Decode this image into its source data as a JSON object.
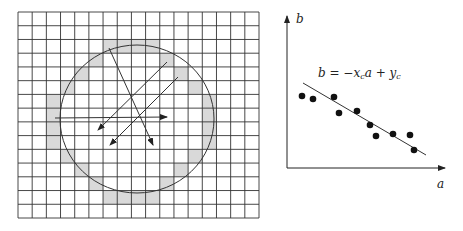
{
  "colors": {
    "grid_line": "#333333",
    "shade": "#d9d9d9",
    "stroke": "#333333",
    "point": "#111111",
    "background": "#ffffff"
  },
  "left_panel": {
    "grid": {
      "x0": 18,
      "y0": 12,
      "x1": 259,
      "y1": 218,
      "cols": 17,
      "rows": 15
    },
    "shaded_cells": [
      [
        2,
        6
      ],
      [
        2,
        7
      ],
      [
        2,
        8
      ],
      [
        2,
        9
      ],
      [
        3,
        5
      ],
      [
        3,
        10
      ],
      [
        4,
        4
      ],
      [
        4,
        11
      ],
      [
        5,
        3
      ],
      [
        5,
        12
      ],
      [
        6,
        2
      ],
      [
        6,
        13
      ],
      [
        7,
        2
      ],
      [
        7,
        13
      ],
      [
        8,
        2
      ],
      [
        8,
        13
      ],
      [
        9,
        2
      ],
      [
        9,
        13
      ],
      [
        10,
        3
      ],
      [
        10,
        12
      ],
      [
        11,
        4
      ],
      [
        11,
        11
      ],
      [
        12,
        5
      ],
      [
        12,
        10
      ],
      [
        13,
        6
      ],
      [
        13,
        7
      ],
      [
        13,
        8
      ],
      [
        13,
        9
      ]
    ],
    "circle": {
      "cx": 137,
      "cy": 119,
      "rx": 77,
      "ry": 74
    },
    "arrows": [
      {
        "name": "steep-arrow",
        "x1": 109,
        "y1": 48,
        "x2": 153,
        "y2": 145
      },
      {
        "name": "diagonal-arrow-upper",
        "x1": 167,
        "y1": 62,
        "x2": 98,
        "y2": 130
      },
      {
        "name": "diagonal-arrow-lower",
        "x1": 178,
        "y1": 77,
        "x2": 110,
        "y2": 145
      },
      {
        "name": "horizontal-arrow",
        "x1": 55,
        "y1": 118,
        "x2": 167,
        "y2": 117
      }
    ]
  },
  "right_panel": {
    "y_axis": {
      "x": 287,
      "y_top": 16,
      "y_bottom": 168,
      "label": "b"
    },
    "x_axis": {
      "y": 168,
      "x_left": 287,
      "x_right": 445,
      "label": "a"
    },
    "equation": {
      "lhs": "b",
      "eq": " = −",
      "x": "x",
      "x_sub": "c",
      "a": "a",
      "plus": " + ",
      "y": "y",
      "y_sub": "c"
    },
    "fit_line": {
      "x1": 303,
      "y1": 83,
      "x2": 426,
      "y2": 155
    }
  },
  "chart_data": {
    "type": "scatter",
    "title": "",
    "xlabel": "a",
    "ylabel": "b",
    "annotation": "b = −x_c a + y_c",
    "grid": false,
    "points_px": [
      [
        302,
        96
      ],
      [
        313,
        99
      ],
      [
        334,
        97
      ],
      [
        339,
        113
      ],
      [
        357,
        111
      ],
      [
        370,
        125
      ],
      [
        376,
        136
      ],
      [
        393,
        134
      ],
      [
        410,
        135
      ],
      [
        414,
        150
      ]
    ],
    "fit_line_px": [
      [
        303,
        83
      ],
      [
        426,
        155
      ]
    ]
  }
}
